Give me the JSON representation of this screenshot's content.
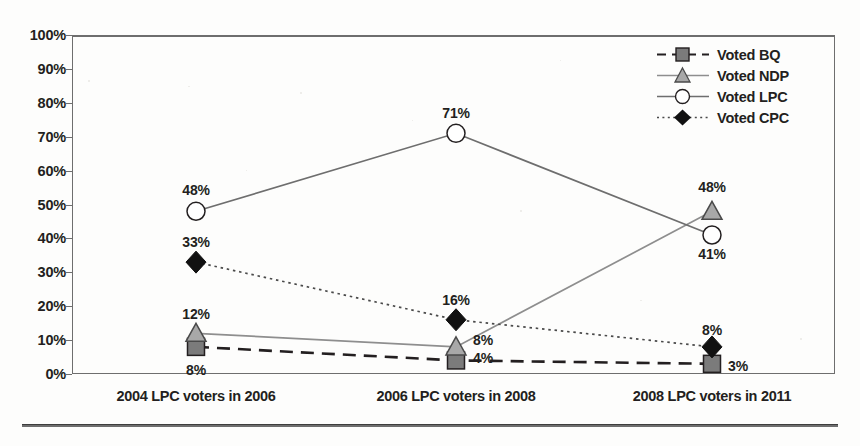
{
  "chart_data": {
    "type": "line",
    "title": "",
    "xlabel": "",
    "ylabel": "",
    "ylim": [
      0,
      100
    ],
    "grid": false,
    "legend_position": "top-right-inside",
    "categories": [
      "2004 LPC voters in 2006",
      "2006 LPC voters in 2008",
      "2008 LPC voters in 2011"
    ],
    "y_ticks": [
      "0%",
      "10%",
      "20%",
      "30%",
      "40%",
      "50%",
      "60%",
      "70%",
      "80%",
      "90%",
      "100%"
    ],
    "series": [
      {
        "name": "Voted BQ",
        "values": [
          8,
          4,
          3
        ],
        "labels": [
          "8%",
          "4%",
          "3%"
        ],
        "marker": "square",
        "line_style": "dashed",
        "line_color": "#231f20",
        "marker_fill": "#7b7b7b",
        "marker_stroke": "#231f20"
      },
      {
        "name": "Voted NDP",
        "values": [
          12,
          8,
          48
        ],
        "labels": [
          "12%",
          "8%",
          "48%"
        ],
        "marker": "triangle",
        "line_style": "solid",
        "line_color": "#8e8e8e",
        "marker_fill": "#a8a8a8",
        "marker_stroke": "#4a4a4a"
      },
      {
        "name": "Voted LPC",
        "values": [
          48,
          71,
          41
        ],
        "labels": [
          "48%",
          "71%",
          "41%"
        ],
        "marker": "circle",
        "line_style": "solid",
        "line_color": "#6e6e6e",
        "marker_fill": "#ffffff",
        "marker_stroke": "#231f20"
      },
      {
        "name": "Voted CPC",
        "values": [
          33,
          16,
          8
        ],
        "labels": [
          "33%",
          "16%",
          "8%"
        ],
        "marker": "diamond",
        "line_style": "dotted",
        "line_color": "#4a4a4a",
        "marker_fill": "#111111",
        "marker_stroke": "#111111"
      }
    ]
  },
  "axis": {
    "y_ticks": [
      "100%",
      "90%",
      "80%",
      "70%",
      "60%",
      "50%",
      "40%",
      "30%",
      "20%",
      "10%",
      "0%"
    ],
    "x_categories": [
      "2004 LPC voters in 2006",
      "2006 LPC voters in 2008",
      "2008 LPC voters in 2011"
    ]
  },
  "legend": {
    "items": [
      {
        "label": "Voted BQ"
      },
      {
        "label": "Voted NDP"
      },
      {
        "label": "Voted LPC"
      },
      {
        "label": "Voted CPC"
      }
    ]
  },
  "data_labels": [
    {
      "text": "48%",
      "x": 196,
      "y": 190
    },
    {
      "text": "33%",
      "x": 196,
      "y": 242
    },
    {
      "text": "12%",
      "x": 196,
      "y": 314
    },
    {
      "text": "8%",
      "x": 196,
      "y": 370
    },
    {
      "text": "71%",
      "x": 456,
      "y": 113
    },
    {
      "text": "16%",
      "x": 456,
      "y": 300
    },
    {
      "text": "8%",
      "x": 483,
      "y": 340
    },
    {
      "text": "4%",
      "x": 483,
      "y": 358
    },
    {
      "text": "48%",
      "x": 712,
      "y": 187
    },
    {
      "text": "41%",
      "x": 712,
      "y": 254
    },
    {
      "text": "8%",
      "x": 712,
      "y": 330
    },
    {
      "text": "3%",
      "x": 738,
      "y": 366
    }
  ]
}
